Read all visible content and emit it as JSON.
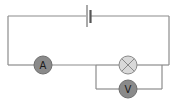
{
  "diagram": {
    "type": "electric-circuit",
    "colors": {
      "wire": "#8c8c8c",
      "battery": "#555555",
      "meter_fill": "#8a8a8a",
      "meter_stroke": "#6e6e6e",
      "lamp_fill": "#d9d9d9",
      "lamp_stroke": "#8a8a8a",
      "label": "#1a1a1a"
    },
    "components": {
      "battery": {
        "label": ""
      },
      "ammeter": {
        "label": "A"
      },
      "lamp": {
        "label": ""
      },
      "voltmeter": {
        "label": "V"
      }
    }
  }
}
